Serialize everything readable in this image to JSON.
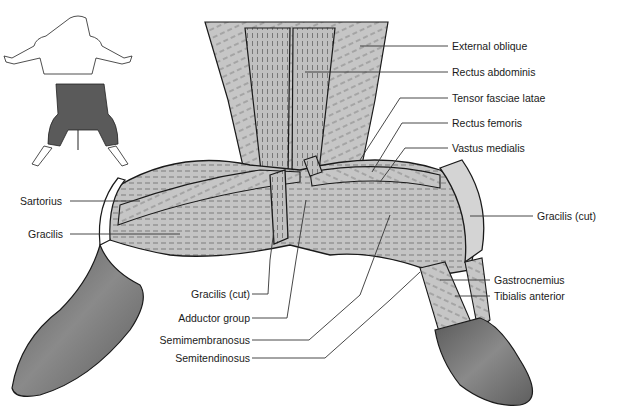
{
  "figure": {
    "inset": {
      "label": "orientation-inset",
      "highlight_color": "#555555"
    },
    "colors": {
      "muscle_fill": "#bdbdbd",
      "muscle_dark": "#9a9a9a",
      "skin_fill": "#6e6e6e",
      "outline": "#1a1a1a",
      "leader_line": "#333333"
    }
  },
  "labels": {
    "right": [
      {
        "text": "External oblique"
      },
      {
        "text": "Rectus abdominis"
      },
      {
        "text": "Tensor fasciae latae"
      },
      {
        "text": "Rectus femoris"
      },
      {
        "text": "Vastus medialis"
      },
      {
        "text": "Gracilis (cut)"
      },
      {
        "text": "Gastrocnemius"
      },
      {
        "text": "Tibialis anterior"
      }
    ],
    "left": [
      {
        "text": "Sartorius"
      },
      {
        "text": "Gracilis"
      }
    ],
    "bottom": [
      {
        "text": "Gracilis (cut)"
      },
      {
        "text": "Adductor group"
      },
      {
        "text": "Semimembranosus"
      },
      {
        "text": "Semitendinosus"
      }
    ]
  }
}
